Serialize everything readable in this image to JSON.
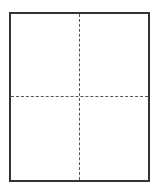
{
  "diagram": {
    "type": "page-quadrant-layout",
    "frame": {
      "border_color": "#333333",
      "fill_color": "#ffffff"
    },
    "guides": [
      {
        "orientation": "vertical",
        "style": "dashed",
        "color": "#555555",
        "position": "center"
      },
      {
        "orientation": "horizontal",
        "style": "dashed",
        "color": "#555555",
        "position": "middle"
      }
    ],
    "quadrants": [
      {
        "id": "top-left",
        "label": ""
      },
      {
        "id": "top-right",
        "label": ""
      },
      {
        "id": "bottom-left",
        "label": ""
      },
      {
        "id": "bottom-right",
        "label": ""
      }
    ]
  }
}
